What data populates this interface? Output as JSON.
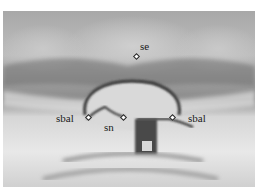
{
  "image": {
    "description": "Grayscale photograph of the nasal base region of an infant face with anthropometric landmarks marked",
    "landmarks": [
      {
        "id": "se",
        "label": "se",
        "x": 136,
        "y": 56
      },
      {
        "id": "sbal_left",
        "label": "sbal",
        "x": 88,
        "y": 118
      },
      {
        "id": "sn",
        "label": "sn",
        "x": 124,
        "y": 118
      },
      {
        "id": "sbal_right",
        "label": "sbal",
        "x": 172,
        "y": 118
      }
    ]
  }
}
